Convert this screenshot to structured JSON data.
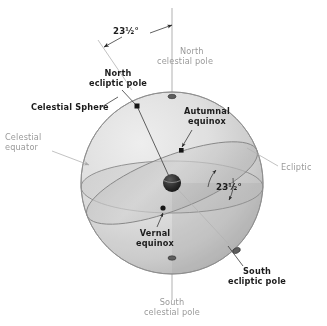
{
  "figure": {
    "background_color": "#ffffff"
  },
  "colors": {
    "label_dark": "#1c1c1c",
    "label_grey": "#9a9a9a",
    "sphere_outline": "#8d8d8d",
    "axis_grey": "#b8b8b8",
    "ring_outline": "#8a8a8a",
    "earth_dark": "#242424"
  },
  "labels": {
    "obliquity_top": "23½°",
    "obliquity_inner": "23½°",
    "north_celestial_pole": "North\ncelestial pole",
    "north_celestial_pole_line1": "North",
    "north_celestial_pole_line2": "celestial pole",
    "north_ecliptic_pole_line1": "North",
    "north_ecliptic_pole_line2": "ecliptic pole",
    "celestial_sphere": "Celestial Sphere",
    "celestial_equator_line1": "Celestial",
    "celestial_equator_line2": "equator",
    "autumnal_equinox_line1": "Autumnal",
    "autumnal_equinox_line2": "equinox",
    "ecliptic": "Ecliptic",
    "vernal_equinox_line1": "Vernal",
    "vernal_equinox_line2": "equinox",
    "south_ecliptic_pole_line1": "South",
    "south_ecliptic_pole_line2": "ecliptic pole",
    "south_celestial_pole_line1": "South",
    "south_celestial_pole_line2": "celestial pole"
  },
  "annotations": [
    {
      "name": "obliquity-top",
      "text": "23½°",
      "style": "dark-bold"
    },
    {
      "name": "north-celestial-pole",
      "text": "North celestial pole",
      "style": "grey"
    },
    {
      "name": "north-ecliptic-pole",
      "text": "North ecliptic pole",
      "style": "dark-bold"
    },
    {
      "name": "celestial-sphere",
      "text": "Celestial Sphere",
      "style": "dark-bold"
    },
    {
      "name": "celestial-equator",
      "text": "Celestial equator",
      "style": "grey"
    },
    {
      "name": "autumnal-equinox",
      "text": "Autumnal equinox",
      "style": "dark-bold"
    },
    {
      "name": "ecliptic",
      "text": "Ecliptic",
      "style": "grey"
    },
    {
      "name": "obliquity-inner",
      "text": "23½°",
      "style": "dark-bold"
    },
    {
      "name": "vernal-equinox",
      "text": "Vernal equinox",
      "style": "dark-bold"
    },
    {
      "name": "south-ecliptic-pole",
      "text": "South ecliptic pole",
      "style": "dark-bold"
    },
    {
      "name": "south-celestial-pole",
      "text": "South celestial pole",
      "style": "grey"
    }
  ],
  "geometry": {
    "sphere_center_x": 172,
    "sphere_center_y": 183,
    "sphere_radius": 91,
    "earth_radius": 9,
    "celestial_axis_top_y": 8,
    "celestial_axis_bottom_y": 300,
    "obliquity_degrees": 23.5
  }
}
